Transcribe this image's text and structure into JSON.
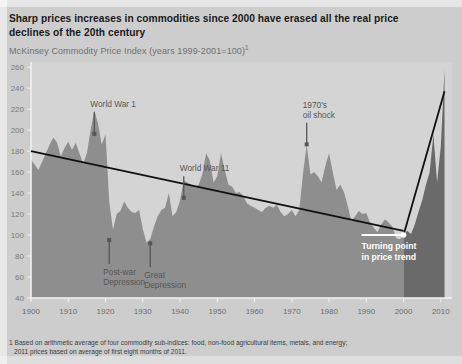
{
  "title": "Sharp prices increases in commodities since 2000 have erased all the real price declines of the 20th century",
  "subtitle_main": "McKinsey Commodity Price Index (years 1999-2001=100)",
  "subtitle_sup": "1",
  "footnote_line1": "1 Based on arithmetic average of four commodity sub-indices: food, non-food agricultural items, metals, and energy;",
  "footnote_line2": "2011 prices based on average of first eight months of 2011.",
  "colors": {
    "page_background": "#cdcdcd",
    "plot_background": "#d4d4d4",
    "area_fill": "#8e8e8e",
    "area_fill_recent": "#6a6a6a",
    "trend_line": "#111111",
    "axis": "#f2f2f2",
    "annotation_text": "#565656",
    "callout_text": "#ffffff",
    "title_text": "#1a1a1a",
    "subtitle_text": "#6f6f6f"
  },
  "annotations": [
    {
      "name": "world-war-1",
      "label": "World War 1",
      "lines": [
        "World War 1"
      ],
      "arrow": "down",
      "year": 1917,
      "value": 196
    },
    {
      "name": "post-war-depression",
      "label": "Post-war Depression",
      "lines": [
        "Post-war",
        "Depression"
      ],
      "arrow": "up",
      "year": 1921,
      "value": 99
    },
    {
      "name": "great-depression",
      "label": "Great Depression",
      "lines": [
        "Great",
        "Depression"
      ],
      "arrow": "up",
      "year": 1932,
      "value": 96
    },
    {
      "name": "world-war-2",
      "label": "World War 11",
      "lines": [
        "World War 11"
      ],
      "arrow": "down",
      "year": 1941,
      "value": 135
    },
    {
      "name": "oil-shock",
      "label": "1970's oil shock",
      "lines": [
        "1970's",
        "oil shock"
      ],
      "arrow": "down",
      "year": 1974,
      "value": 186
    }
  ],
  "callout": {
    "name": "turning-point",
    "lines": [
      "Turning point",
      "in price trend"
    ],
    "year": 2000,
    "value": 100
  },
  "chart_data": {
    "type": "area",
    "title": "McKinsey Commodity Price Index (years 1999-2001=100)",
    "xlabel": "",
    "ylabel": "",
    "xlim": [
      1900,
      2013
    ],
    "ylim": [
      40,
      265
    ],
    "grid": false,
    "legend": false,
    "yticks": [
      40,
      60,
      80,
      100,
      120,
      140,
      160,
      180,
      200,
      220,
      240,
      260
    ],
    "xticks": [
      1900,
      1910,
      1920,
      1930,
      1940,
      1950,
      1960,
      1970,
      1980,
      1990,
      2000,
      2010
    ],
    "series": [
      {
        "name": "McKinsey Commodity Price Index",
        "type": "area",
        "x": [
          1900,
          1901,
          1902,
          1903,
          1904,
          1905,
          1906,
          1907,
          1908,
          1909,
          1910,
          1911,
          1912,
          1913,
          1914,
          1915,
          1916,
          1917,
          1918,
          1919,
          1920,
          1921,
          1922,
          1923,
          1924,
          1925,
          1926,
          1927,
          1928,
          1929,
          1930,
          1931,
          1932,
          1933,
          1934,
          1935,
          1936,
          1937,
          1938,
          1939,
          1940,
          1941,
          1942,
          1943,
          1944,
          1945,
          1946,
          1947,
          1948,
          1949,
          1950,
          1951,
          1952,
          1953,
          1954,
          1955,
          1956,
          1957,
          1958,
          1959,
          1960,
          1961,
          1962,
          1963,
          1964,
          1965,
          1966,
          1967,
          1968,
          1969,
          1970,
          1971,
          1972,
          1973,
          1974,
          1975,
          1976,
          1977,
          1978,
          1979,
          1980,
          1981,
          1982,
          1983,
          1984,
          1985,
          1986,
          1987,
          1988,
          1989,
          1990,
          1991,
          1992,
          1993,
          1994,
          1995,
          1996,
          1997,
          1998,
          1999,
          2000,
          2001,
          2002,
          2003,
          2004,
          2005,
          2006,
          2007,
          2008,
          2009,
          2010,
          2011
        ],
        "y": [
          172,
          167,
          162,
          170,
          178,
          186,
          193,
          188,
          175,
          183,
          189,
          181,
          188,
          178,
          168,
          178,
          200,
          219,
          206,
          186,
          196,
          132,
          105,
          120,
          123,
          132,
          126,
          122,
          121,
          124,
          106,
          93,
          96,
          108,
          118,
          124,
          126,
          140,
          118,
          122,
          133,
          152,
          150,
          148,
          146,
          148,
          158,
          178,
          171,
          150,
          156,
          178,
          162,
          148,
          146,
          140,
          141,
          137,
          130,
          128,
          126,
          124,
          122,
          126,
          128,
          126,
          129,
          122,
          118,
          120,
          124,
          118,
          124,
          158,
          186,
          158,
          160,
          156,
          150,
          166,
          178,
          160,
          143,
          148,
          141,
          128,
          113,
          118,
          123,
          120,
          121,
          112,
          107,
          103,
          110,
          115,
          112,
          108,
          97,
          96,
          100,
          104,
          101,
          110,
          122,
          133,
          148,
          160,
          196,
          150,
          185,
          258
        ],
        "fill_color": "#8e8e8e",
        "fill_color_after_2000": "#6a6a6a",
        "split_year": 2000
      },
      {
        "name": "Declining trend 1900-2000",
        "type": "line",
        "x": [
          1900,
          2000
        ],
        "y": [
          180,
          104
        ],
        "color": "#111111"
      },
      {
        "name": "Rising trend 2000-2011",
        "type": "line",
        "x": [
          2000,
          2011
        ],
        "y": [
          100,
          237
        ],
        "color": "#111111"
      }
    ]
  }
}
